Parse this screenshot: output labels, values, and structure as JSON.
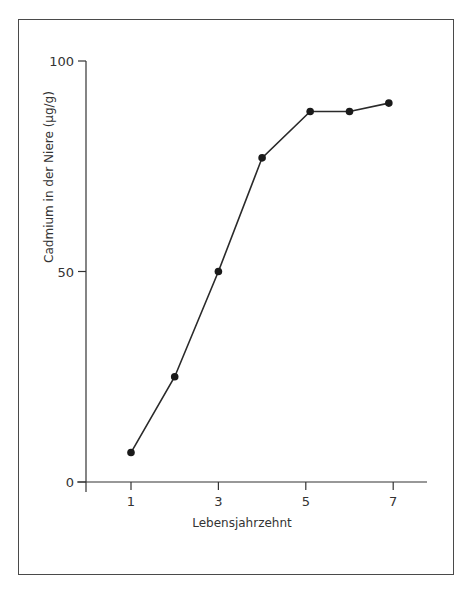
{
  "chart_data": {
    "type": "line",
    "title": "",
    "xlabel": "Lebensjahrzehnt",
    "ylabel": "Cadmium in der Niere (µg/g)",
    "x": [
      1,
      2,
      3,
      4,
      5.1,
      6,
      6.9
    ],
    "series": [
      {
        "name": "Cadmium",
        "values": [
          7,
          25,
          50,
          77,
          88,
          88,
          90
        ]
      }
    ],
    "x_ticks": [
      "1",
      "3",
      "5",
      "7"
    ],
    "y_ticks": [
      "0",
      "50",
      "100"
    ],
    "xlim": [
      0,
      8
    ],
    "ylim": [
      0,
      100
    ],
    "grid": false,
    "legend": "none",
    "marker": "filled-circle"
  },
  "axes": {
    "x_title": "Lebensjahrzehnt",
    "y_title": "Cadmium in der Niere (µg/g)",
    "x_tick_labels": [
      "1",
      "3",
      "5",
      "7"
    ],
    "y_tick_labels": [
      "0",
      "50",
      "100"
    ]
  }
}
